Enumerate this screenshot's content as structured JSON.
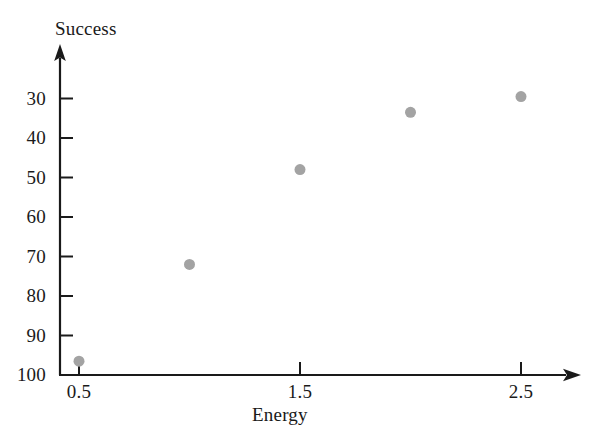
{
  "chart_data": {
    "type": "scatter",
    "title": "",
    "xlabel": "Energy",
    "ylabel": "Success",
    "x": [
      0.5,
      1.0,
      1.5,
      2.0,
      2.5
    ],
    "values": [
      33.5,
      58,
      82,
      96.5,
      100.5
    ],
    "series": [
      {
        "name": "Success",
        "points": [
          {
            "x": 0.5,
            "y": 33.5
          },
          {
            "x": 1.0,
            "y": 58
          },
          {
            "x": 1.5,
            "y": 82
          },
          {
            "x": 2.0,
            "y": 96.5
          },
          {
            "x": 2.5,
            "y": 100.5
          }
        ]
      }
    ],
    "xlim": [
      0.36,
      2.85
    ],
    "ylim": [
      30,
      105
    ],
    "x_ticks": [
      0.5,
      1.5,
      2.5
    ],
    "x_tick_labels": [
      "0.5",
      "1.5",
      "2.5"
    ],
    "y_ticks": [
      30,
      40,
      50,
      60,
      70,
      80,
      90,
      100
    ],
    "y_tick_labels": [
      "30",
      "40",
      "50",
      "60",
      "70",
      "80",
      "90",
      "100"
    ],
    "grid": false,
    "legend": false,
    "legend_position": "none",
    "marker": "circle",
    "marker_color": "#a3a3a3",
    "marker_size": 11,
    "axis_color": "#1a1a1a",
    "background_color": "#ffffff",
    "x_axis_arrow": true,
    "y_axis_arrow": true
  },
  "axes": {
    "y_title": "Success",
    "x_title": "Energy"
  },
  "ticks": {
    "y": [
      {
        "label": "100",
        "value": 100
      },
      {
        "label": "90",
        "value": 90
      },
      {
        "label": "80",
        "value": 80
      },
      {
        "label": "70",
        "value": 70
      },
      {
        "label": "60",
        "value": 60
      },
      {
        "label": "50",
        "value": 50
      },
      {
        "label": "40",
        "value": 40
      },
      {
        "label": "30",
        "value": 30
      }
    ],
    "x": [
      {
        "label": "0.5",
        "value": 0.5
      },
      {
        "label": "1.5",
        "value": 1.5
      },
      {
        "label": "2.5",
        "value": 2.5
      }
    ]
  }
}
